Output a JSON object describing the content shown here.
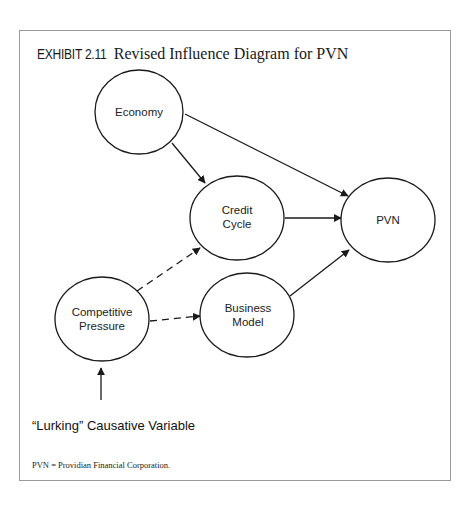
{
  "exhibit": {
    "label": "EXHIBIT 2.11",
    "title": "Revised Influence Diagram for PVN"
  },
  "nodes": {
    "economy": {
      "lines": [
        "Economy"
      ]
    },
    "credit_cycle": {
      "lines": [
        "Credit",
        "Cycle"
      ]
    },
    "pvn": {
      "lines": [
        "PVN"
      ]
    },
    "competitive_pressure": {
      "lines": [
        "Competitive",
        "Pressure"
      ]
    },
    "business_model": {
      "lines": [
        "Business",
        "Model"
      ]
    }
  },
  "edges": [
    {
      "from": "Economy",
      "to": "Credit Cycle",
      "style": "solid"
    },
    {
      "from": "Economy",
      "to": "PVN",
      "style": "solid"
    },
    {
      "from": "Credit Cycle",
      "to": "PVN",
      "style": "solid"
    },
    {
      "from": "Business Model",
      "to": "PVN",
      "style": "solid"
    },
    {
      "from": "Competitive Pressure",
      "to": "Credit Cycle",
      "style": "dashed"
    },
    {
      "from": "Competitive Pressure",
      "to": "Business Model",
      "style": "dashed"
    },
    {
      "from": "\"Lurking\" Causative Variable",
      "to": "Competitive Pressure",
      "style": "solid"
    }
  ],
  "lurking_label": "“Lurking” Causative Variable",
  "footnote": "PVN = Providian Financial Corporation.",
  "colors": {
    "stroke": "#1a1a1a",
    "frame": "#9a9a9a",
    "background": "#ffffff"
  }
}
